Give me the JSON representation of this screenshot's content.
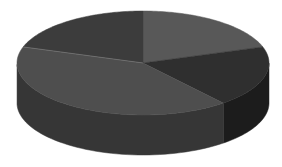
{
  "chart_data": {
    "type": "pie",
    "style": "3d",
    "title": "",
    "legend": [],
    "labels_visible": false,
    "categories": [
      "Slice A",
      "Slice B",
      "Slice C",
      "Slice D"
    ],
    "values": [
      20,
      19,
      41,
      20
    ],
    "unit": "percent (estimated from angles)",
    "start_angle_deg": 90,
    "direction": "clockwise",
    "colors": {
      "top": [
        "#585858",
        "#2f2f2f",
        "#4e4e4e",
        "#3c3c3c"
      ],
      "side": [
        "#3e3e3e",
        "#1c1c1c",
        "#363636",
        "#2a2a2a"
      ]
    }
  },
  "geometry": {
    "cx": 143,
    "cy": 63,
    "rx": 126,
    "ry": 52,
    "depth": 40
  }
}
